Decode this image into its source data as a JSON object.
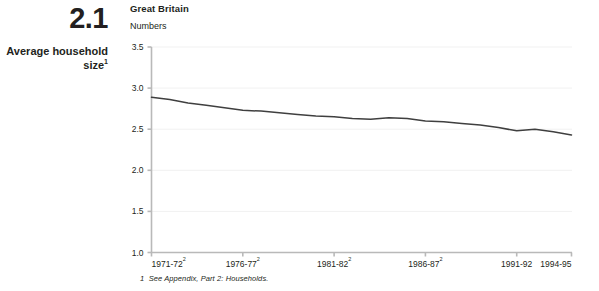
{
  "figure": {
    "number": "2.1",
    "title": "Average household size",
    "title_superscript": "1"
  },
  "chart_header": {
    "region": "Great Britain",
    "units": "Numbers"
  },
  "footnote": {
    "marker": "1",
    "text": "See Appendix, Part 2: Households."
  },
  "colors": {
    "line": "#3f3f3f",
    "axis": "#b9b9b9",
    "grid": "#f1f1f1",
    "text": "#231f20"
  },
  "chart_data": {
    "type": "line",
    "title": "Average household size",
    "subtitle": "Great Britain",
    "xlabel": "",
    "ylabel": "Numbers",
    "ylim": [
      1.0,
      3.5
    ],
    "ytick_values": [
      1.0,
      1.5,
      2.0,
      2.5,
      3.0,
      3.5
    ],
    "ytick_labels": [
      "1.0",
      "1.5",
      "2.0",
      "2.5",
      "3.0",
      "3.5"
    ],
    "grid": true,
    "legend": "none",
    "xtick_labels": [
      {
        "text": "1971-72",
        "sup": "2"
      },
      {
        "text": "1976-77",
        "sup": "2"
      },
      {
        "text": "1981-82",
        "sup": "2"
      },
      {
        "text": "1986-87",
        "sup": "2"
      },
      {
        "text": "1991-92",
        "sup": ""
      },
      {
        "text": "1994-95",
        "sup": ""
      }
    ],
    "xtick_positions": [
      0,
      5,
      10,
      15,
      20,
      23
    ],
    "x": [
      "1971-72",
      "1972-73",
      "1973-74",
      "1974-75",
      "1975-76",
      "1976-77",
      "1977-78",
      "1978-79",
      "1979-80",
      "1980-81",
      "1981-82",
      "1982-83",
      "1983-84",
      "1984-85",
      "1985-86",
      "1986-87",
      "1987-88",
      "1988-89",
      "1989-90",
      "1990-91",
      "1991-92",
      "1992-93",
      "1993-94",
      "1994-95"
    ],
    "series": [
      {
        "name": "Average household size",
        "values": [
          2.89,
          2.86,
          2.82,
          2.79,
          2.76,
          2.73,
          2.72,
          2.7,
          2.68,
          2.66,
          2.65,
          2.63,
          2.62,
          2.64,
          2.63,
          2.6,
          2.59,
          2.57,
          2.55,
          2.52,
          2.48,
          2.5,
          2.47,
          2.43
        ]
      }
    ]
  }
}
